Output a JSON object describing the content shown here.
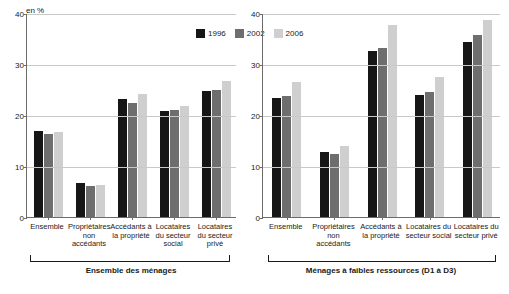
{
  "unit_label": "en %",
  "legend": [
    {
      "name": "legend-1996",
      "label": "1996",
      "color": "#161616"
    },
    {
      "name": "legend-2002",
      "label": "2002",
      "color": "#6e6e6e"
    },
    {
      "name": "legend-2006",
      "label": "2006",
      "color": "#cfcfcf"
    }
  ],
  "panels": [
    {
      "id": "left",
      "footer": "Ensemble des ménages"
    },
    {
      "id": "right",
      "footer": "Ménages à faibles ressources (D1 à D3)"
    }
  ],
  "chart_data": [
    {
      "type": "bar",
      "title": "Ensemble des ménages",
      "xlabel": "",
      "ylabel": "en %",
      "ylim": [
        0,
        40
      ],
      "yticks": [
        0,
        10,
        20,
        30,
        40
      ],
      "grid": true,
      "legend_position": "top-center",
      "categories": [
        "Ensemble",
        "Propriétaires non accédants",
        "Accédants à la propriété",
        "Locataires du secteur social",
        "Locataires du secteur privé"
      ],
      "series": [
        {
          "name": "1996",
          "color": "#161616",
          "values": [
            16.8,
            6.6,
            23.1,
            20.7,
            24.7
          ]
        },
        {
          "name": "2002",
          "color": "#6e6e6e",
          "values": [
            16.2,
            6.1,
            22.4,
            20.9,
            24.9
          ]
        },
        {
          "name": "2006",
          "color": "#cfcfcf",
          "values": [
            16.7,
            6.2,
            24.2,
            21.7,
            26.7
          ]
        }
      ]
    },
    {
      "type": "bar",
      "title": "Ménages à faibles ressources (D1 à D3)",
      "xlabel": "",
      "ylabel": "en %",
      "ylim": [
        0,
        40
      ],
      "yticks": [
        0,
        10,
        20,
        30,
        40
      ],
      "grid": true,
      "legend_position": "top-center",
      "categories": [
        "Ensemble",
        "Propriétaires non accédants",
        "Accédants à la propriété",
        "Locataires du secteur social",
        "Locataires du secteur privé"
      ],
      "series": [
        {
          "name": "1996",
          "color": "#161616",
          "values": [
            23.4,
            12.8,
            32.5,
            23.9,
            34.3
          ]
        },
        {
          "name": "2002",
          "color": "#6e6e6e",
          "values": [
            23.7,
            12.4,
            33.2,
            24.6,
            35.7
          ]
        },
        {
          "name": "2006",
          "color": "#cfcfcf",
          "values": [
            26.5,
            14.0,
            37.6,
            27.4,
            38.7
          ]
        }
      ]
    }
  ]
}
